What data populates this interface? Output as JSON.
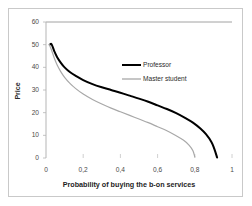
{
  "chart_data": {
    "type": "line",
    "title": "",
    "xlabel": "Probability of buying the b-on services",
    "ylabel": "Price",
    "xlim": [
      0,
      1
    ],
    "ylim": [
      0,
      60
    ],
    "xticks": [
      "0",
      "0,2",
      "0,4",
      "0,6",
      "0,8",
      "1"
    ],
    "xtick_values": [
      0,
      0.2,
      0.4,
      0.6,
      0.8,
      1
    ],
    "yticks": [
      "0",
      "10",
      "20",
      "30",
      "40",
      "50",
      "60"
    ],
    "ytick_values": [
      0,
      10,
      20,
      30,
      40,
      50,
      60
    ],
    "grid": false,
    "legend_position": "upper right",
    "series": [
      {
        "name": "Professor",
        "color": "#000000",
        "width": 2.0,
        "x": [
          0.02,
          0.03,
          0.045,
          0.06,
          0.08,
          0.1,
          0.13,
          0.16,
          0.2,
          0.25,
          0.3,
          0.35,
          0.4,
          0.45,
          0.5,
          0.55,
          0.6,
          0.65,
          0.7,
          0.75,
          0.79,
          0.83,
          0.86,
          0.89,
          0.905,
          0.92
        ],
        "y": [
          50.0,
          50.2,
          47.0,
          44.5,
          42.0,
          40.0,
          37.8,
          36.2,
          34.4,
          32.6,
          31.2,
          30.0,
          28.8,
          27.5,
          26.2,
          24.8,
          23.2,
          21.6,
          19.8,
          17.6,
          15.6,
          13.0,
          10.5,
          7.0,
          4.0,
          0.2
        ]
      },
      {
        "name": "Master student",
        "color": "#a8a8a8",
        "width": 1.2,
        "x": [
          0.018,
          0.028,
          0.045,
          0.06,
          0.08,
          0.1,
          0.13,
          0.16,
          0.2,
          0.25,
          0.3,
          0.35,
          0.4,
          0.45,
          0.5,
          0.55,
          0.6,
          0.65,
          0.7,
          0.74,
          0.77,
          0.79,
          0.8
        ],
        "y": [
          50.0,
          48.0,
          44.0,
          41.0,
          38.0,
          35.6,
          32.8,
          30.6,
          28.2,
          25.8,
          23.8,
          22.0,
          20.4,
          18.8,
          17.2,
          15.6,
          13.8,
          12.0,
          9.8,
          7.8,
          5.6,
          3.2,
          0.5
        ]
      }
    ]
  },
  "legend": {
    "items": [
      {
        "label": "Professor"
      },
      {
        "label": "Master student"
      }
    ]
  }
}
